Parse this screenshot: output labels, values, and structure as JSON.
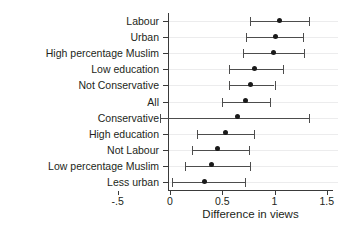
{
  "chart_data": {
    "type": "scatter",
    "subtype": "forest-plot",
    "title": "",
    "xlabel": "Difference in views",
    "ylabel": "",
    "xlim": [
      -0.5,
      1.5
    ],
    "xticks": [
      -0.5,
      0,
      0.5,
      1,
      1.5
    ],
    "xticklabels": [
      "-.5",
      "0",
      "0.5",
      "1",
      "1.5"
    ],
    "grid": "horizontal",
    "legend": "none",
    "orientation": "horizontal",
    "marker_color": "#1a1a1a",
    "line_color": "#4d4d4d",
    "categories": [
      "Labour",
      "Urban",
      "High percentage Muslim",
      "Low education",
      "Not Conservative",
      "All",
      "Conservative",
      "High education",
      "Not Labour",
      "Low percentage Muslim",
      "Less urban"
    ],
    "points": [
      {
        "label": "Labour",
        "estimate": 1.05,
        "ci_low": 0.77,
        "ci_high": 1.33
      },
      {
        "label": "Urban",
        "estimate": 1.01,
        "ci_low": 0.73,
        "ci_high": 1.27
      },
      {
        "label": "High percentage Muslim",
        "estimate": 0.99,
        "ci_low": 0.7,
        "ci_high": 1.28
      },
      {
        "label": "Low education",
        "estimate": 0.81,
        "ci_low": 0.56,
        "ci_high": 1.08
      },
      {
        "label": "Not Conservative",
        "estimate": 0.77,
        "ci_low": 0.56,
        "ci_high": 1.0
      },
      {
        "label": "All",
        "estimate": 0.72,
        "ci_low": 0.5,
        "ci_high": 0.96
      },
      {
        "label": "Conservative",
        "estimate": 0.65,
        "ci_low": -0.1,
        "ci_high": 1.33
      },
      {
        "label": "High education",
        "estimate": 0.53,
        "ci_low": 0.26,
        "ci_high": 0.8
      },
      {
        "label": "Not Labour",
        "estimate": 0.45,
        "ci_low": 0.21,
        "ci_high": 0.76
      },
      {
        "label": "Low percentage Muslim",
        "estimate": 0.4,
        "ci_low": 0.14,
        "ci_high": 0.77
      },
      {
        "label": "Less urban",
        "estimate": 0.33,
        "ci_low": 0.02,
        "ci_high": 0.72
      }
    ]
  }
}
